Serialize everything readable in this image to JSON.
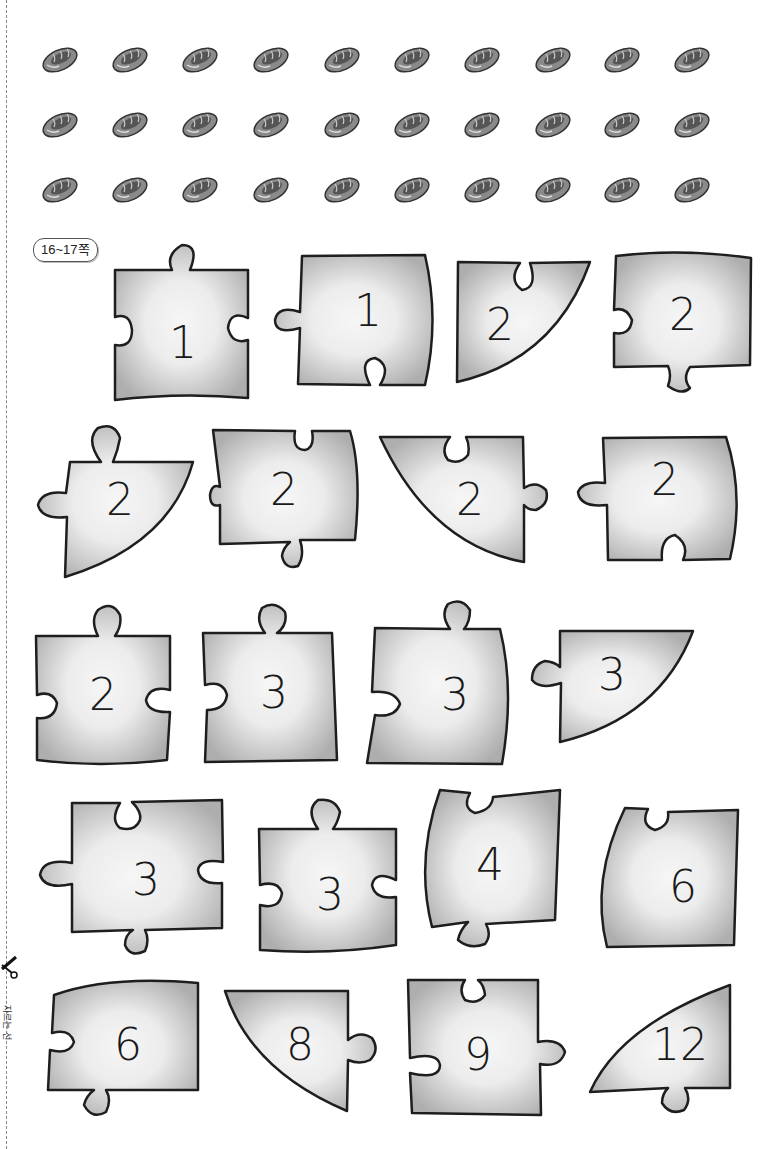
{
  "page": {
    "badge": "16~17쪽",
    "cut_label": "자르는 선"
  },
  "bread_grid": {
    "rows": 3,
    "cols": 10,
    "icon": "bread-icon",
    "count": 30
  },
  "puzzle_pieces": [
    {
      "id": 1,
      "number": "1"
    },
    {
      "id": 2,
      "number": "1"
    },
    {
      "id": 3,
      "number": "2"
    },
    {
      "id": 4,
      "number": "2"
    },
    {
      "id": 5,
      "number": "2"
    },
    {
      "id": 6,
      "number": "2"
    },
    {
      "id": 7,
      "number": "2"
    },
    {
      "id": 8,
      "number": "2"
    },
    {
      "id": 9,
      "number": "2"
    },
    {
      "id": 10,
      "number": "3"
    },
    {
      "id": 11,
      "number": "3"
    },
    {
      "id": 12,
      "number": "3"
    },
    {
      "id": 13,
      "number": "3"
    },
    {
      "id": 14,
      "number": "3"
    },
    {
      "id": 15,
      "number": "4"
    },
    {
      "id": 16,
      "number": "6"
    },
    {
      "id": 17,
      "number": "6"
    },
    {
      "id": 18,
      "number": "8"
    },
    {
      "id": 19,
      "number": "9"
    },
    {
      "id": 20,
      "number": "12"
    }
  ],
  "colors": {
    "piece_fill": "#b4b4b4",
    "piece_center": "#f4f4f4",
    "outline": "#1e1e1e"
  }
}
